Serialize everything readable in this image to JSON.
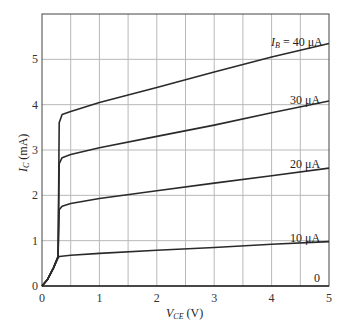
{
  "chart_data": {
    "type": "line",
    "title": "",
    "xlabel": "V_CE (V)",
    "ylabel": "I_C (mA)",
    "xlim": [
      0,
      5
    ],
    "ylim": [
      0,
      6
    ],
    "grid": true,
    "x_ticks": [
      "0",
      "1",
      "2",
      "3",
      "4",
      "5"
    ],
    "y_ticks": [
      "0",
      "1",
      "2",
      "3",
      "4",
      "5"
    ],
    "legend_position": "inline labels at right end of curves",
    "series": [
      {
        "name": "I_B = 40 μA",
        "label": "I_B = 40 μA",
        "x": [
          0,
          0.1,
          0.2,
          0.28,
          0.3,
          0.35,
          0.5,
          1,
          2,
          3,
          4,
          5
        ],
        "y": [
          0,
          0.15,
          0.4,
          0.65,
          3.6,
          3.78,
          3.85,
          4.05,
          4.38,
          4.72,
          5.05,
          5.35
        ]
      },
      {
        "name": "30 μA",
        "label": "30 μA",
        "x": [
          0,
          0.1,
          0.2,
          0.28,
          0.3,
          0.35,
          0.5,
          1,
          2,
          3,
          4,
          5
        ],
        "y": [
          0,
          0.15,
          0.4,
          0.65,
          2.7,
          2.83,
          2.9,
          3.05,
          3.3,
          3.55,
          3.82,
          4.08
        ]
      },
      {
        "name": "20 μA",
        "label": "20 μA",
        "x": [
          0,
          0.1,
          0.2,
          0.28,
          0.3,
          0.35,
          0.5,
          1,
          2,
          3,
          4,
          5
        ],
        "y": [
          0,
          0.15,
          0.4,
          0.65,
          1.68,
          1.76,
          1.82,
          1.93,
          2.1,
          2.27,
          2.43,
          2.6
        ]
      },
      {
        "name": "10 μA",
        "label": "10 μA",
        "x": [
          0,
          0.1,
          0.2,
          0.28,
          0.3,
          0.5,
          1,
          2,
          3,
          4,
          5
        ],
        "y": [
          0,
          0.15,
          0.4,
          0.62,
          0.65,
          0.68,
          0.72,
          0.79,
          0.85,
          0.92,
          0.98
        ]
      },
      {
        "name": "0",
        "label": "0",
        "x": [
          0,
          5
        ],
        "y": [
          0,
          0
        ]
      }
    ]
  },
  "labels": {
    "xlabel_main": "V",
    "xlabel_sub": "CE",
    "xlabel_unit": " (V)",
    "ylabel_main": "I",
    "ylabel_sub": "C",
    "ylabel_unit": " (mA)",
    "curve_40_prefix": "I",
    "curve_40_sub": "B",
    "curve_40_rest": " = 40 μA",
    "curve_30": "30 μA",
    "curve_20": "20 μA",
    "curve_10": "10 μA",
    "curve_0": "0"
  },
  "colors": {
    "line": "#2a2a2a",
    "grid": "#b8b8b8",
    "frame": "#444444"
  }
}
